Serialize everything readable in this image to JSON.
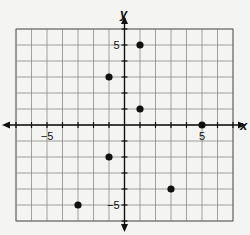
{
  "chart_data": {
    "type": "scatter",
    "title": "",
    "xlabel": "x",
    "ylabel": "y",
    "xlim": [
      -7,
      7
    ],
    "ylim": [
      -6,
      6
    ],
    "grid": true,
    "x_tick_labels": [
      {
        "value": -5,
        "label": "−5"
      },
      {
        "value": 5,
        "label": "5"
      }
    ],
    "y_tick_labels": [
      {
        "value": 5,
        "label": "5"
      },
      {
        "value": -5,
        "label": "−5"
      }
    ],
    "points": [
      {
        "x": 1,
        "y": 5
      },
      {
        "x": -1,
        "y": 3
      },
      {
        "x": 1,
        "y": 1
      },
      {
        "x": 5,
        "y": 0
      },
      {
        "x": -1,
        "y": -2
      },
      {
        "x": 3,
        "y": -4
      },
      {
        "x": -3,
        "y": -5
      }
    ]
  },
  "colors": {
    "background": "#f4f4f2",
    "grid": "#8a8a8a",
    "axis": "#111111",
    "point": "#111111"
  }
}
